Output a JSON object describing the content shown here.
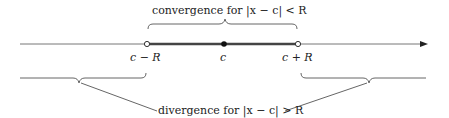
{
  "diagram": {
    "title_top": "convergence for |x − c| < R",
    "title_bottom": "divergence for |x − c| > R",
    "points": {
      "left": "c − R",
      "center": "c",
      "right": "c + R"
    },
    "colors": {
      "ink": "#222222",
      "line": "#666666",
      "interval": "#444444"
    }
  }
}
